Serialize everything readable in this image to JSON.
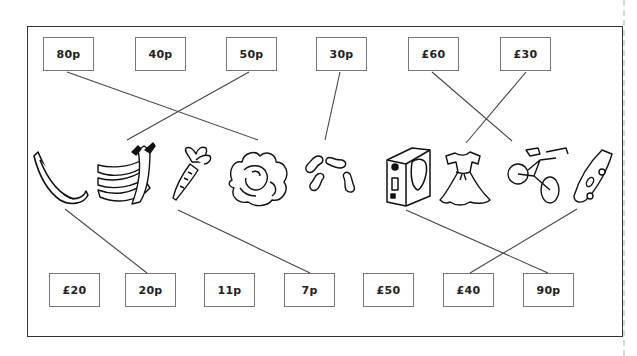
{
  "worksheet": {
    "task": "Match each item to its price",
    "top_prices": [
      {
        "label": "80p",
        "x": 43,
        "y": 37
      },
      {
        "label": "40p",
        "x": 135,
        "y": 37
      },
      {
        "label": "50p",
        "x": 226,
        "y": 37
      },
      {
        "label": "30p",
        "x": 316,
        "y": 37
      },
      {
        "label": "£60",
        "x": 408,
        "y": 37
      },
      {
        "label": "£30",
        "x": 500,
        "y": 37
      }
    ],
    "bottom_prices": [
      {
        "label": "£20",
        "x": 49,
        "y": 273
      },
      {
        "label": "20p",
        "x": 125,
        "y": 273
      },
      {
        "label": "11p",
        "x": 204,
        "y": 273
      },
      {
        "label": "7p",
        "x": 284,
        "y": 273
      },
      {
        "label": "£50",
        "x": 363,
        "y": 273
      },
      {
        "label": "£40",
        "x": 443,
        "y": 273
      },
      {
        "label": "90p",
        "x": 523,
        "y": 273
      }
    ],
    "items": [
      {
        "name": "banana",
        "icon": "banana-icon"
      },
      {
        "name": "bunch of bananas",
        "icon": "banana-bunch-icon"
      },
      {
        "name": "carrot",
        "icon": "carrot-icon"
      },
      {
        "name": "lettuce",
        "icon": "lettuce-icon"
      },
      {
        "name": "peanuts",
        "icon": "peanuts-icon"
      },
      {
        "name": "boxed game",
        "icon": "game-box-icon"
      },
      {
        "name": "dress",
        "icon": "dress-icon"
      },
      {
        "name": "bicycle",
        "icon": "bicycle-icon"
      },
      {
        "name": "skateboard",
        "icon": "skateboard-icon"
      }
    ],
    "connections": [
      {
        "from": "80p",
        "to": "lettuce",
        "x1": 67,
        "y1": 72,
        "x2": 258,
        "y2": 140
      },
      {
        "from": "50p",
        "to": "bunch of bananas",
        "x1": 249,
        "y1": 72,
        "x2": 127,
        "y2": 140
      },
      {
        "from": "30p",
        "to": "peanuts",
        "x1": 340,
        "y1": 72,
        "x2": 325,
        "y2": 140
      },
      {
        "from": "£60",
        "to": "bicycle",
        "x1": 432,
        "y1": 72,
        "x2": 512,
        "y2": 141
      },
      {
        "from": "£30",
        "to": "dress",
        "x1": 526,
        "y1": 72,
        "x2": 466,
        "y2": 143
      },
      {
        "from": "banana",
        "to": "20p",
        "x1": 65,
        "y1": 209,
        "x2": 147,
        "y2": 273
      },
      {
        "from": "carrot",
        "to": "7p",
        "x1": 178,
        "y1": 210,
        "x2": 310,
        "y2": 273
      },
      {
        "from": "boxed game",
        "to": "90p",
        "x1": 406,
        "y1": 210,
        "x2": 548,
        "y2": 273
      },
      {
        "from": "skateboard",
        "to": "£40",
        "x1": 577,
        "y1": 209,
        "x2": 470,
        "y2": 273
      }
    ]
  }
}
